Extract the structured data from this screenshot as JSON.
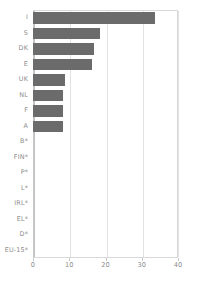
{
  "chart_data": {
    "type": "bar",
    "orientation": "horizontal",
    "title": "",
    "subtitle": "",
    "xlabel": "",
    "ylabel": "",
    "xlim": [
      0,
      40
    ],
    "xticks": [
      0,
      10,
      20,
      30,
      40
    ],
    "xtick_labels": [
      "0",
      "10",
      "20",
      "30",
      "40"
    ],
    "grid": true,
    "grid_axis": "x",
    "legend": false,
    "legend_position": "none",
    "bar_color": "#6b6b6b",
    "grid_color": "#e2e2e2",
    "axis_color": "#c8c8c8",
    "label_color": "#8c8c8c",
    "categories": [
      "I",
      "S",
      "DK",
      "E",
      "UK",
      "NL",
      "F",
      "A",
      "B*",
      "FIN*",
      "P*",
      "L*",
      "IRL*",
      "EL*",
      "D*",
      "EU-15*"
    ],
    "values": [
      33.7,
      18.5,
      16.8,
      16.2,
      8.8,
      8.3,
      8.3,
      8.2,
      0,
      0,
      0,
      0,
      0,
      0,
      0,
      0
    ]
  }
}
